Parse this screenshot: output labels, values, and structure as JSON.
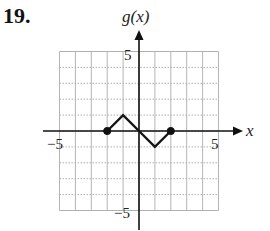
{
  "problem": {
    "number": "19."
  },
  "chart_data": {
    "type": "line",
    "title": "",
    "xlabel": "x",
    "ylabel": "g(x)",
    "xlim": [
      -5,
      5
    ],
    "ylim": [
      -5,
      5
    ],
    "grid": true,
    "x_tick_labels": [
      "-5",
      "5"
    ],
    "y_tick_labels": [
      "5",
      "-5"
    ],
    "series": [
      {
        "name": "g(x)",
        "x": [
          -2,
          -1,
          0,
          1,
          2
        ],
        "y": [
          0,
          1,
          0,
          -1,
          0
        ],
        "endpoints": [
          {
            "x": -2,
            "y": 0,
            "style": "closed"
          },
          {
            "x": 2,
            "y": 0,
            "style": "closed"
          }
        ]
      }
    ]
  },
  "labels": {
    "x_axis": "x",
    "y_axis": "g(x)",
    "x_min": "−5",
    "x_max": "5",
    "y_max": "5",
    "y_min": "−5"
  }
}
